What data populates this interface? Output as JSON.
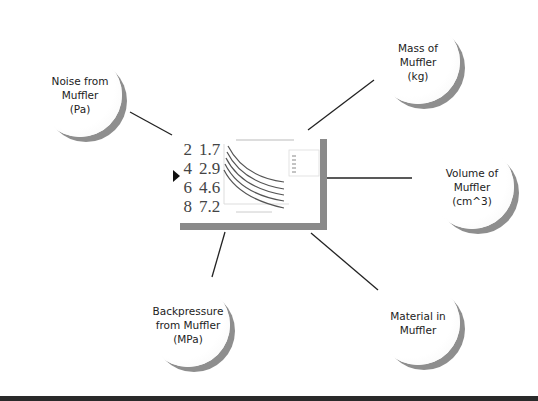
{
  "diagram": {
    "center": {
      "table_rows": [
        {
          "x": "2",
          "y": "1.7"
        },
        {
          "x": "4",
          "y": "2.9"
        },
        {
          "x": "6",
          "y": "4.6"
        },
        {
          "x": "8",
          "y": "7.2"
        }
      ],
      "pointer_icon": "triangle-right",
      "mini_chart": {
        "series_count": 5,
        "legend_entries": 5
      }
    },
    "bubbles": [
      {
        "id": "noise",
        "label": "Noise from\nMuffler\n(Pa)"
      },
      {
        "id": "mass",
        "label": "Mass of\nMuffler\n(kg)"
      },
      {
        "id": "volume",
        "label": "Volume of\nMuffler\n(cm^3)"
      },
      {
        "id": "backpressure",
        "label": "Backpressure\nfrom Muffler\n(MPa)"
      },
      {
        "id": "material",
        "label": "Material in\nMuffler"
      }
    ],
    "colors": {
      "shadow": "#8a8a8a",
      "line": "#222222",
      "footer": "#2a2a2a"
    }
  }
}
